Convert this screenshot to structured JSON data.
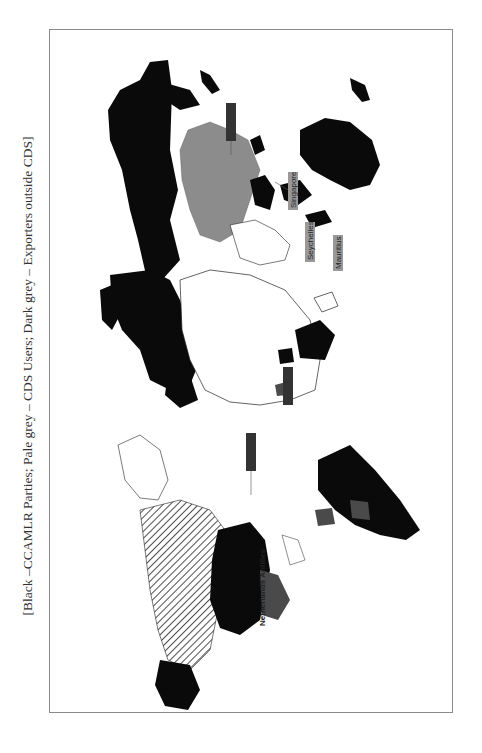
{
  "caption": "[Black –CCAMLR Parties; Pale grey – CDS Users; Dark grey – Exporters outside CDS]",
  "legend": {
    "black": {
      "label": "CCAMLR Parties",
      "color": "#0a0a0a"
    },
    "pale_grey": {
      "label": "CDS Users",
      "color": "#8c8c8c"
    },
    "dark_grey": {
      "label": "Exporters outside CDS",
      "color": "#4a4a4a"
    }
  },
  "map": {
    "orientation": "rotated 90° counter-clockwise (north to the left)",
    "labels": [
      {
        "text": "Singapore",
        "style": "pale_grey"
      },
      {
        "text": "Seychelles",
        "style": "pale_grey"
      },
      {
        "text": "Mauritius",
        "style": "pale_grey"
      },
      {
        "text": "Netherlands Antilles",
        "style": "plain"
      },
      {
        "text": "",
        "style": "dark_grey"
      },
      {
        "text": "",
        "style": "dark_grey"
      },
      {
        "text": "",
        "style": "dark_grey"
      }
    ]
  }
}
